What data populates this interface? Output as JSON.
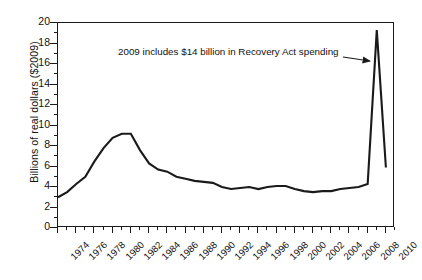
{
  "chart_data": {
    "type": "line",
    "title": "",
    "subtitle": "",
    "xlabel": "",
    "ylabel": "Billions of real dollars ($2009)",
    "xlim": [
      1974,
      2011
    ],
    "ylim": [
      0,
      20
    ],
    "ytick_step": 2,
    "xtick_step": 2,
    "grid": false,
    "legend": null,
    "ytick_labels": [
      "20",
      "18",
      "16",
      "14",
      "12",
      "10",
      "8",
      "6",
      "4",
      "2",
      "0"
    ],
    "ytick_values": [
      20,
      18,
      16,
      14,
      12,
      10,
      8,
      6,
      4,
      2,
      0
    ],
    "xtick_labels": [
      "1974",
      "1976",
      "1978",
      "1980",
      "1982",
      "1984",
      "1986",
      "1988",
      "1990",
      "1992",
      "1994",
      "1996",
      "1998",
      "2000",
      "2002",
      "2004",
      "2006",
      "2008",
      "2010"
    ],
    "xtick_values": [
      1974,
      1976,
      1978,
      1980,
      1982,
      1984,
      1986,
      1988,
      1990,
      1992,
      1994,
      1996,
      1998,
      2000,
      2002,
      2004,
      2006,
      2008,
      2010
    ],
    "x": [
      1974,
      1975,
      1976,
      1977,
      1978,
      1979,
      1980,
      1981,
      1982,
      1983,
      1984,
      1985,
      1986,
      1987,
      1988,
      1989,
      1990,
      1991,
      1992,
      1993,
      1994,
      1995,
      1996,
      1997,
      1998,
      1999,
      2000,
      2001,
      2002,
      2003,
      2004,
      2005,
      2006,
      2007,
      2008,
      2009,
      2010
    ],
    "values": [
      3.0,
      3.5,
      4.3,
      5.0,
      6.5,
      7.8,
      8.8,
      9.2,
      9.2,
      7.6,
      6.3,
      5.7,
      5.5,
      5.0,
      4.8,
      4.6,
      4.5,
      4.4,
      4.0,
      3.8,
      3.9,
      4.0,
      3.8,
      4.0,
      4.1,
      4.1,
      3.8,
      3.6,
      3.5,
      3.6,
      3.6,
      3.8,
      3.9,
      4.0,
      4.3,
      19.3,
      5.9
    ],
    "annotations": [
      {
        "text": "2009 includes $14 billion in Recovery Act spending",
        "points_to_x": 2009,
        "points_to_y": 16.2,
        "arrow": true
      }
    ],
    "series_color": "#1a1a1a",
    "axis_color": "#1a1a1a",
    "background_color": "#ffffff"
  }
}
